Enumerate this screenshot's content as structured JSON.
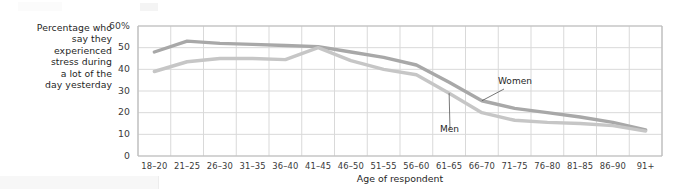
{
  "chart_data": {
    "type": "line",
    "title": "",
    "xlabel": "Age of respondent",
    "ylabel": "Percentage who say they experienced stress during a lot of the day yesterday",
    "ylabel_lines": [
      "Percentage who",
      "say they",
      "experienced",
      "stress during",
      "a lot of the",
      "day yesterday"
    ],
    "categories": [
      "18–20",
      "21–25",
      "26–30",
      "31–35",
      "36–40",
      "41–45",
      "46–50",
      "51–55",
      "56–60",
      "61–65",
      "66–70",
      "71–75",
      "76–80",
      "81–85",
      "86–90",
      "91+"
    ],
    "ylim": [
      0,
      60
    ],
    "yticks": [
      0,
      10,
      20,
      30,
      40,
      50,
      60
    ],
    "yticklabels": [
      "0",
      "10",
      "20",
      "30",
      "40",
      "50",
      "60%"
    ],
    "grid": true,
    "legend": "none",
    "annotations": [
      {
        "text": "Women",
        "series": "Women",
        "category": "66–70"
      },
      {
        "text": "Men",
        "series": "Men",
        "category": "61–65"
      }
    ],
    "series": [
      {
        "name": "Women",
        "color": "#a8a8a8",
        "values": [
          48,
          53,
          52,
          51.5,
          51,
          50.5,
          48,
          45.5,
          42,
          34,
          25.5,
          22,
          20,
          18,
          15.5,
          12
        ]
      },
      {
        "name": "Men",
        "color": "#c6c6c6",
        "values": [
          39,
          43.5,
          45,
          45,
          44.5,
          50,
          44,
          40,
          37.5,
          29,
          20,
          16.5,
          15.5,
          15,
          14,
          11.5
        ]
      }
    ]
  },
  "axis": {
    "y_tick_unit_suffix": "%",
    "x_title": "Age of respondent"
  },
  "colors": {
    "women_line": "#a8a8a8",
    "men_line": "#c6c6c6",
    "grid": "#d9d9d9",
    "axis": "#bcbcbc",
    "text": "#1f1f1f"
  }
}
